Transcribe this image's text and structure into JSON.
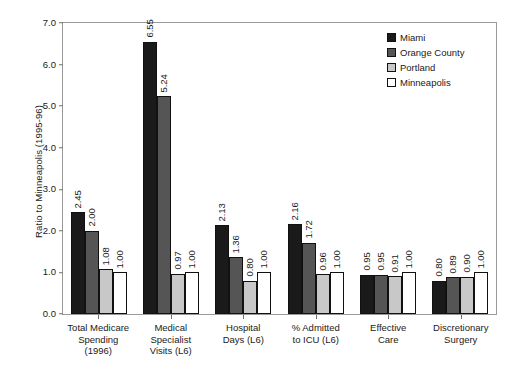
{
  "chart_data": {
    "type": "bar",
    "title": "",
    "xlabel": "",
    "ylabel": "Ratio to Minneapolis (1995-96)",
    "ylim": [
      0.0,
      7.0
    ],
    "yticks": [
      "0.0",
      "1.0",
      "2.0",
      "3.0",
      "4.0",
      "5.0",
      "6.0",
      "7.0"
    ],
    "grid": false,
    "legend_position": "top-right",
    "categories": [
      "Total Medicare\nSpending\n(1996)",
      "Medical\nSpecialist\nVisits (L6)",
      "Hospital\nDays (L6)",
      "% Admitted\nto ICU (L6)",
      "Effective\nCare",
      "Discretionary\nSurgery"
    ],
    "series": [
      {
        "name": "Miami",
        "color": "#1a1a1a",
        "values": [
          2.45,
          6.55,
          2.13,
          2.16,
          0.95,
          0.8
        ],
        "labels": [
          "2.45",
          "6.55",
          "2.13",
          "2.16",
          "0.95",
          "0.80"
        ]
      },
      {
        "name": "Orange County",
        "color": "#555555",
        "values": [
          2.0,
          5.24,
          1.36,
          1.72,
          0.95,
          0.89
        ],
        "labels": [
          "2.00",
          "5.24",
          "1.36",
          "1.72",
          "0.95",
          "0.89"
        ]
      },
      {
        "name": "Portland",
        "color": "#c8c8c8",
        "values": [
          1.08,
          0.97,
          0.8,
          0.96,
          0.91,
          0.9
        ],
        "labels": [
          "1.08",
          "0.97",
          "0.80",
          "0.96",
          "0.91",
          "0.90"
        ]
      },
      {
        "name": "Minneapolis",
        "color": "#ffffff",
        "values": [
          1.0,
          1.0,
          1.0,
          1.0,
          1.0,
          1.0
        ],
        "labels": [
          "1.00",
          "1.00",
          "1.00",
          "1.00",
          "1.00",
          "1.00"
        ]
      }
    ]
  }
}
